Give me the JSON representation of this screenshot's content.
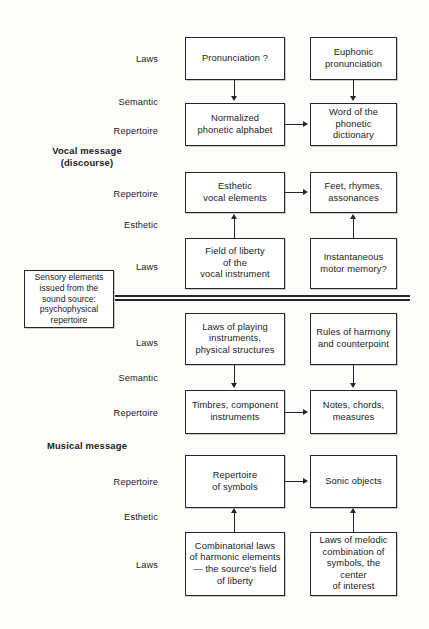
{
  "diagram": {
    "group_labels": [
      {
        "id": "vocal",
        "text": "Vocal  message\n(discourse)"
      },
      {
        "id": "musical",
        "text": "Musical message"
      }
    ],
    "side_box": {
      "text": "Sensory elements\nissued from the\nsound  source:\npsychophysical\nrepertoire"
    },
    "row_labels": [
      {
        "id": "r1",
        "text": "Laws"
      },
      {
        "id": "r2",
        "text": "Semantic"
      },
      {
        "id": "r3",
        "text": "Repertoire"
      },
      {
        "id": "r4",
        "text": "Repertoire"
      },
      {
        "id": "r5",
        "text": "Esthetic"
      },
      {
        "id": "r6",
        "text": "Laws"
      },
      {
        "id": "r7",
        "text": "Laws"
      },
      {
        "id": "r8",
        "text": "Semantic"
      },
      {
        "id": "r9",
        "text": "Repertoire"
      },
      {
        "id": "r10",
        "text": "Repertoire"
      },
      {
        "id": "r11",
        "text": "Esthetic"
      },
      {
        "id": "r12",
        "text": "Laws"
      }
    ],
    "nodes": [
      {
        "id": "n1",
        "text": "Pronunciation ?"
      },
      {
        "id": "n2",
        "text": "Euphonic\npronunciation"
      },
      {
        "id": "n3",
        "text": "Normalized\nphonetic alphabet"
      },
      {
        "id": "n4",
        "text": "Word of the\nphonetic dictionary"
      },
      {
        "id": "n5",
        "text": "Esthetic\nvocal elements"
      },
      {
        "id": "n6",
        "text": "Feet, rhymes,\nassonances"
      },
      {
        "id": "n7",
        "text": "Field of liberty\nof the\nvocal instrument"
      },
      {
        "id": "n8",
        "text": "Instantaneous\nmotor memory?"
      },
      {
        "id": "n9",
        "text": "Laws of playing\ninstruments,\nphysical structures"
      },
      {
        "id": "n10",
        "text": "Rules of harmony\nand  counterpoint"
      },
      {
        "id": "n11",
        "text": "Timbres, component\ninstruments"
      },
      {
        "id": "n12",
        "text": "Notes, chords,\nmeasures"
      },
      {
        "id": "n13",
        "text": "Repertoire\nof symbols"
      },
      {
        "id": "n14",
        "text": "Sonic objects"
      },
      {
        "id": "n15",
        "text": "Combinatorial laws\nof harmonic elements\n— the source's field\nof liberty"
      },
      {
        "id": "n16",
        "text": "Laws of melodic\ncombination of\nsymbols, the center\nof interest"
      }
    ],
    "colors": {
      "ink": "#262626",
      "paper": "#fdfdfb",
      "box_fill": "#ffffff"
    }
  }
}
